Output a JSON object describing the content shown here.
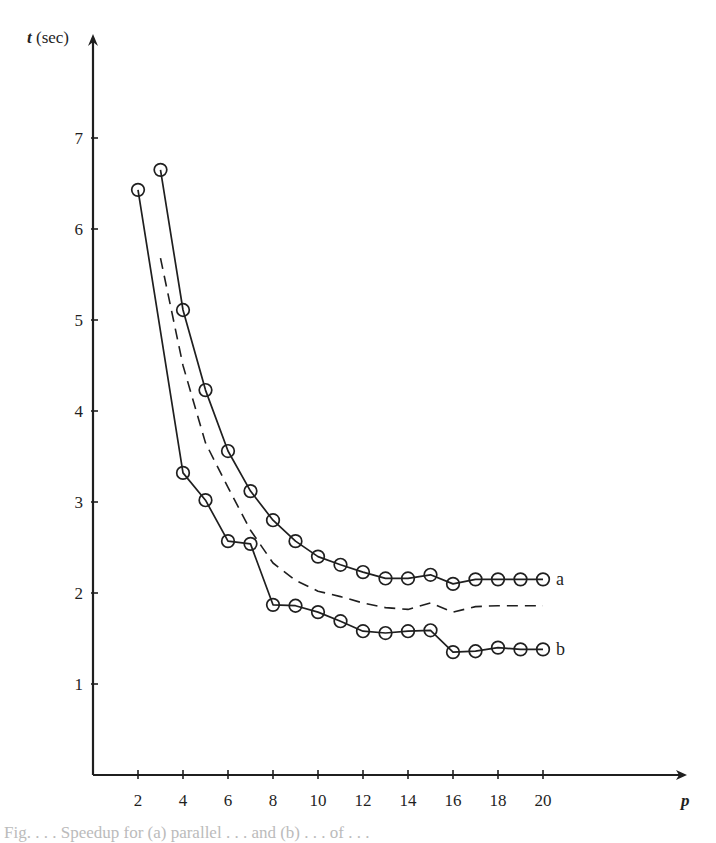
{
  "chart_data": {
    "type": "line",
    "title": "",
    "xlabel": "p",
    "ylabel": "t (sec)",
    "xlim": [
      0,
      26
    ],
    "ylim": [
      0,
      7.6
    ],
    "grid": false,
    "legend": "inline labels at right end of curves",
    "x_ticks": [
      2,
      4,
      6,
      8,
      10,
      12,
      14,
      16,
      18,
      20
    ],
    "y_ticks": [
      1,
      2,
      3,
      4,
      5,
      6,
      7
    ],
    "series": [
      {
        "name": "a",
        "style": "solid-with-circles",
        "x": [
          3,
          4,
          5,
          6,
          7,
          8,
          9,
          10,
          11,
          12,
          13,
          14,
          15,
          16,
          17,
          18,
          19,
          20
        ],
        "values": [
          6.65,
          5.11,
          4.23,
          3.56,
          3.12,
          2.8,
          2.57,
          2.4,
          2.31,
          2.23,
          2.16,
          2.16,
          2.2,
          2.1,
          2.15,
          2.15,
          2.15,
          2.15
        ]
      },
      {
        "name": "b",
        "style": "solid-with-circles",
        "x": [
          2,
          4,
          5,
          6,
          7,
          8,
          9,
          10,
          11,
          12,
          13,
          14,
          15,
          16,
          17,
          18,
          19,
          20
        ],
        "values": [
          6.43,
          3.32,
          3.02,
          2.57,
          2.54,
          1.87,
          1.86,
          1.79,
          1.69,
          1.58,
          1.56,
          1.58,
          1.59,
          1.35,
          1.36,
          1.4,
          1.38,
          1.38
        ]
      },
      {
        "name": "dashed (no label)",
        "style": "dashed",
        "x": [
          3,
          4,
          5,
          6,
          7,
          8,
          9,
          10,
          11,
          12,
          13,
          14,
          15,
          16,
          17,
          18,
          19,
          20
        ],
        "values": [
          5.68,
          4.5,
          3.65,
          3.16,
          2.69,
          2.33,
          2.14,
          2.02,
          1.96,
          1.89,
          1.84,
          1.82,
          1.89,
          1.79,
          1.85,
          1.86,
          1.86,
          1.86
        ]
      }
    ]
  },
  "axes": {
    "y_title_italic": "t",
    "y_title_rest": " (sec)",
    "x_title": "p"
  },
  "labels": {
    "a": "a",
    "b": "b"
  },
  "caption": "Fig. . . .  Speedup for (a) parallel . . . and (b) . . . of . . ."
}
